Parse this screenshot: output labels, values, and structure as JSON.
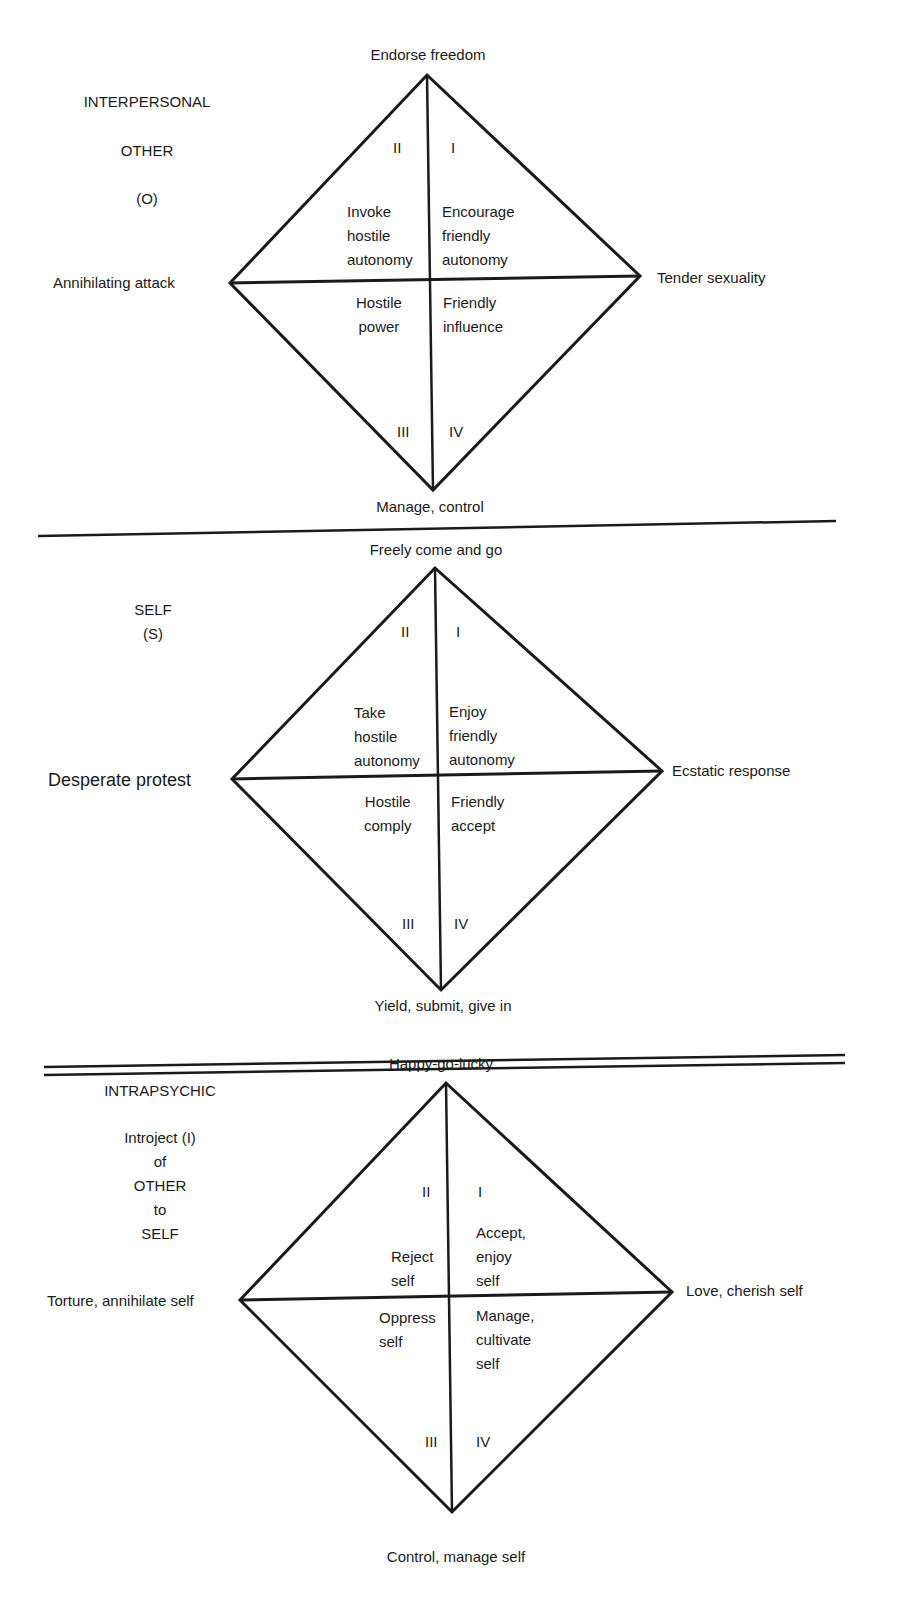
{
  "panels": [
    {
      "id": "interpersonal",
      "side_label": [
        "INTERPERSONAL",
        "OTHER",
        "(O)"
      ],
      "top": "Endorse freedom",
      "bottom": "Manage, control",
      "left": "Annihilating attack",
      "right": "Tender sexuality",
      "quadrant_numerals": {
        "q1": "I",
        "q2": "II",
        "q3": "III",
        "q4": "IV"
      },
      "cells": {
        "upper_left": "Invoke\nhostile\nautonomy",
        "upper_right": "Encourage\nfriendly\nautonomy",
        "lower_left": "Hostile\npower",
        "lower_right": "Friendly\ninfluence"
      }
    },
    {
      "id": "self",
      "side_label": [
        "SELF",
        "(S)"
      ],
      "top": "Freely come and go",
      "bottom": "Yield, submit, give in",
      "left": "Desperate protest",
      "right": "Ecstatic response",
      "quadrant_numerals": {
        "q1": "I",
        "q2": "II",
        "q3": "III",
        "q4": "IV"
      },
      "cells": {
        "upper_left": "Take\nhostile\nautonomy",
        "upper_right": "Enjoy\nfriendly\nautonomy",
        "lower_left": "Hostile\ncomply",
        "lower_right": "Friendly\naccept"
      }
    },
    {
      "id": "intrapsychic",
      "side_label": [
        "INTRAPSYCHIC",
        "Introject (I)\nof\nOTHER\nto\nSELF"
      ],
      "top": "Happy-go-lucky",
      "bottom": "Control, manage self",
      "left": "Torture, annihilate self",
      "right": "Love, cherish self",
      "quadrant_numerals": {
        "q1": "I",
        "q2": "II",
        "q3": "III",
        "q4": "IV"
      },
      "cells": {
        "upper_left": "Reject\nself",
        "upper_right": "Accept,\nenjoy\nself",
        "lower_left": "Oppress\nself",
        "lower_right": "Manage,\ncultivate\nself"
      }
    }
  ],
  "colors": {
    "ink": "#1a1a1a",
    "background": "#ffffff"
  }
}
